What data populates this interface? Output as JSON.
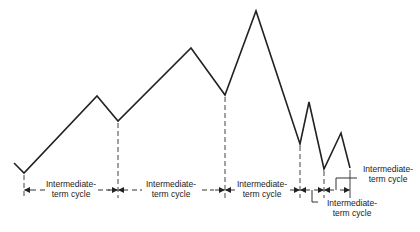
{
  "diagram": {
    "line_color": "#222222",
    "price_path": [
      [
        14,
        163
      ],
      [
        24,
        173
      ],
      [
        97,
        96
      ],
      [
        118,
        121
      ],
      [
        191,
        48
      ],
      [
        225,
        95
      ],
      [
        256,
        11
      ],
      [
        300,
        144
      ],
      [
        309,
        102
      ],
      [
        324,
        169
      ],
      [
        341,
        133
      ],
      [
        350,
        168
      ]
    ],
    "cycle_boundaries_x": [
      24,
      118,
      225,
      300,
      324,
      350
    ],
    "marker_y": 190,
    "labels": {
      "cycle1_line1": "Intermediate-",
      "cycle1_line2": "term cycle",
      "cycle2_line1": "Intermediate-",
      "cycle2_line2": "term cycle",
      "cycle3_line1": "Intermediate-",
      "cycle3_line2": "term cycle",
      "cycle4_line1": "Intermediate-",
      "cycle4_line2": "term cycle",
      "cycle5_line1": "Intermediate-",
      "cycle5_line2": "term cycle"
    }
  }
}
